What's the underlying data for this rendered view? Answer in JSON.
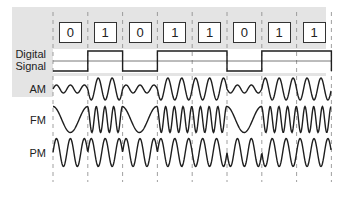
{
  "bits": [
    "0",
    "1",
    "0",
    "1",
    "1",
    "0",
    "1",
    "1"
  ],
  "labels": {
    "digital_line1": "Digital",
    "digital_line2": "Signal",
    "am": "AM",
    "fm": "FM",
    "pm": "PM"
  },
  "colors": {
    "panel": "#e4e4e4",
    "band": "#ffffff",
    "wave": "#1e1e1e",
    "divider": "#888888"
  },
  "layout": {
    "x0": 53,
    "cell": 34.8,
    "rows": {
      "digital": {
        "top": 49,
        "bottom": 73,
        "high": 51,
        "low": 71,
        "mid": 61
      },
      "am": {
        "top": 76,
        "bottom": 102,
        "center": 89
      },
      "fm": {
        "top": 105,
        "bottom": 134,
        "center": 119.5
      },
      "pm": {
        "top": 137,
        "bottom": 168,
        "center": 152.5
      }
    }
  }
}
